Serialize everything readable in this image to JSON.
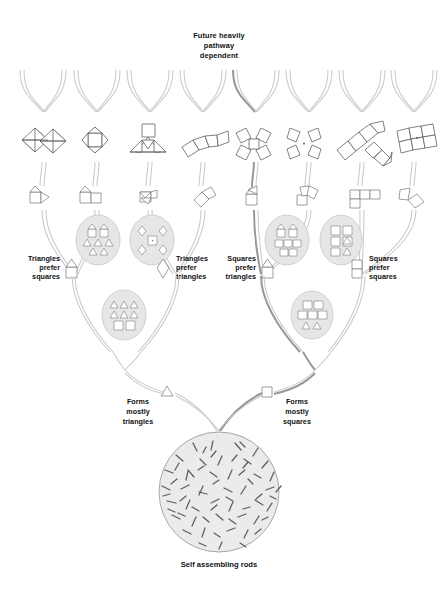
{
  "diagram": {
    "title_top": [
      "Future heavily",
      "pathway",
      "dependent"
    ],
    "caption_bottom": "Self assembling rods",
    "labels": [
      {
        "id": "triangles-prefer-squares",
        "lines": [
          "Triangles",
          "prefer",
          "squares"
        ],
        "align": "right",
        "x": 58,
        "y": 265,
        "icon": "house-up"
      },
      {
        "id": "triangles-prefer-triangles",
        "lines": [
          "Triangles",
          "prefer",
          "triangles"
        ],
        "align": "left",
        "x": 183,
        "y": 265,
        "icon": "diamond"
      },
      {
        "id": "squares-prefer-triangles",
        "lines": [
          "Squares",
          "prefer",
          "triangles"
        ],
        "align": "right",
        "x": 252,
        "y": 265,
        "icon": "house-up"
      },
      {
        "id": "squares-prefer-squares",
        "lines": [
          "Squares",
          "prefer",
          "squares"
        ],
        "align": "left",
        "x": 377,
        "y": 265,
        "icon": "double-square"
      }
    ],
    "outcomes": [
      {
        "id": "forms-mostly-triangles",
        "lines": [
          "Forms",
          "mostly",
          "triangles"
        ],
        "align": "center",
        "x": 138,
        "y": 404,
        "icon": "triangle"
      },
      {
        "id": "forms-mostly-squares",
        "lines": [
          "Forms",
          "mostly",
          "squares"
        ],
        "align": "center",
        "x": 297,
        "y": 404,
        "icon": "square"
      }
    ],
    "clusters": [
      {
        "id": "cluster-tri-sq",
        "cx": 98,
        "cy": 240,
        "rx": 22,
        "ry": 25,
        "contents": "houses-triangles"
      },
      {
        "id": "cluster-tri-tri",
        "cx": 152,
        "cy": 240,
        "rx": 22,
        "ry": 25,
        "contents": "diamonds-square"
      },
      {
        "id": "cluster-sq-tri",
        "cx": 287,
        "cy": 240,
        "rx": 22,
        "ry": 25,
        "contents": "houses-squares"
      },
      {
        "id": "cluster-sq-sq",
        "cx": 341,
        "cy": 240,
        "rx": 21,
        "ry": 25,
        "contents": "squares-triangles"
      },
      {
        "id": "cluster-mixed-left",
        "cx": 124,
        "cy": 315,
        "rx": 22,
        "ry": 25,
        "contents": "triangles-squares"
      },
      {
        "id": "cluster-mixed-right",
        "cx": 312,
        "cy": 315,
        "rx": 21,
        "ry": 24,
        "contents": "squares-triangles2"
      }
    ],
    "colors": {
      "branch": "#c9c9c9",
      "branch_highlight": "#8e8e8e",
      "shape_stroke": "#58585e",
      "cluster_fill": "#e6e6e6",
      "circle_fill": "#ebebeb",
      "text": "#111111",
      "background": "#ffffff"
    },
    "rod_count": 68,
    "big_circle": {
      "cx": 219,
      "cy": 492,
      "r": 60
    }
  }
}
